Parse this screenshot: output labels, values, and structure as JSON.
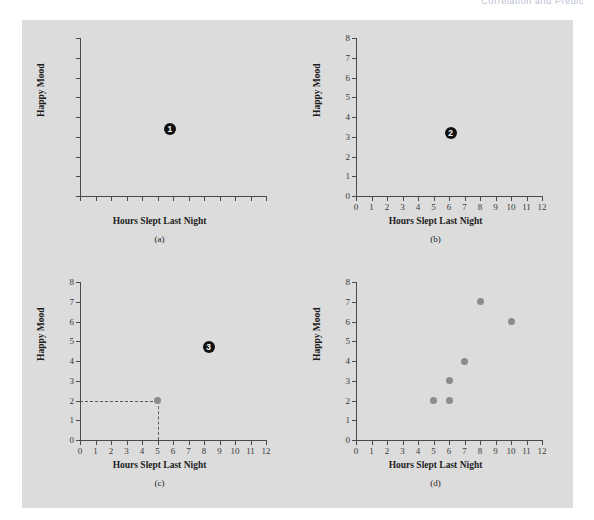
{
  "running_head": "Correlation and Predic",
  "figure": {
    "background_color": "#dcdcdc",
    "page_color": "#ffffff",
    "point_color": "#8b8b8b",
    "badge_color": "#111111",
    "axis_color": "#4a4a4a"
  },
  "common": {
    "xlabel": "Hours Slept Last Night",
    "ylabel": "Happy Mood",
    "xlim": [
      0,
      12
    ],
    "ylim": [
      0,
      8
    ],
    "xticks": [
      0,
      1,
      2,
      3,
      4,
      5,
      6,
      7,
      8,
      9,
      10,
      11,
      12
    ],
    "yticks": [
      0,
      1,
      2,
      3,
      4,
      5,
      6,
      7,
      8
    ],
    "xtick_labels": [
      "0",
      "1",
      "2",
      "3",
      "4",
      "5",
      "6",
      "7",
      "8",
      "9",
      "10",
      "11",
      "12"
    ],
    "ytick_labels": [
      "0",
      "1",
      "2",
      "3",
      "4",
      "5",
      "6",
      "7",
      "8"
    ]
  },
  "chart_data": [
    {
      "id": "a",
      "type": "scatter",
      "caption": "(a)",
      "title": "",
      "xlabel": "Hours Slept Last Night",
      "ylabel": "Happy Mood",
      "xlim": [
        0,
        12
      ],
      "ylim": [
        0,
        8
      ],
      "grid": false,
      "show_tick_labels": false,
      "xtick_labels": [],
      "ytick_labels": [],
      "points": [],
      "annotations": [
        {
          "label": "1",
          "x": 5.8,
          "y": 3.4,
          "style": "numbered-badge"
        }
      ]
    },
    {
      "id": "b",
      "type": "scatter",
      "caption": "(b)",
      "title": "",
      "xlabel": "Hours Slept Last Night",
      "ylabel": "Happy Mood",
      "xlim": [
        0,
        12
      ],
      "ylim": [
        0,
        8
      ],
      "grid": false,
      "show_tick_labels": true,
      "xtick_labels": [
        "0",
        "1",
        "2",
        "3",
        "4",
        "5",
        "6",
        "7",
        "8",
        "9",
        "10",
        "11",
        "12"
      ],
      "ytick_labels": [
        "0",
        "1",
        "2",
        "3",
        "4",
        "5",
        "6",
        "7",
        "8"
      ],
      "points": [],
      "annotations": [
        {
          "label": "2",
          "x": 6.1,
          "y": 3.2,
          "style": "numbered-badge"
        }
      ]
    },
    {
      "id": "c",
      "type": "scatter",
      "caption": "(c)",
      "title": "",
      "xlabel": "Hours Slept Last Night",
      "ylabel": "Happy Mood",
      "xlim": [
        0,
        12
      ],
      "ylim": [
        0,
        8
      ],
      "grid": false,
      "show_tick_labels": true,
      "xtick_labels": [
        "0",
        "1",
        "2",
        "3",
        "4",
        "5",
        "6",
        "7",
        "8",
        "9",
        "10",
        "11",
        "12"
      ],
      "ytick_labels": [
        "0",
        "1",
        "2",
        "3",
        "4",
        "5",
        "6",
        "7",
        "8"
      ],
      "points": [
        {
          "x": 5,
          "y": 2
        }
      ],
      "guides": [
        {
          "kind": "horizontal",
          "y": 2,
          "x_from": 0,
          "x_to": 5
        },
        {
          "kind": "vertical",
          "x": 5,
          "y_from": 0,
          "y_to": 2
        }
      ],
      "annotations": [
        {
          "label": "3",
          "x": 8.3,
          "y": 4.7,
          "style": "numbered-badge"
        }
      ]
    },
    {
      "id": "d",
      "type": "scatter",
      "caption": "(d)",
      "title": "",
      "xlabel": "Hours Slept Last Night",
      "ylabel": "Happy Mood",
      "xlim": [
        0,
        12
      ],
      "ylim": [
        0,
        8
      ],
      "grid": false,
      "show_tick_labels": true,
      "xtick_labels": [
        "0",
        "1",
        "2",
        "3",
        "4",
        "5",
        "6",
        "7",
        "8",
        "9",
        "10",
        "11",
        "12"
      ],
      "ytick_labels": [
        "0",
        "1",
        "2",
        "3",
        "4",
        "5",
        "6",
        "7",
        "8"
      ],
      "points": [
        {
          "x": 5,
          "y": 2
        },
        {
          "x": 6,
          "y": 2
        },
        {
          "x": 6,
          "y": 3
        },
        {
          "x": 7,
          "y": 4
        },
        {
          "x": 8,
          "y": 7
        },
        {
          "x": 10,
          "y": 6
        }
      ],
      "annotations": []
    }
  ]
}
